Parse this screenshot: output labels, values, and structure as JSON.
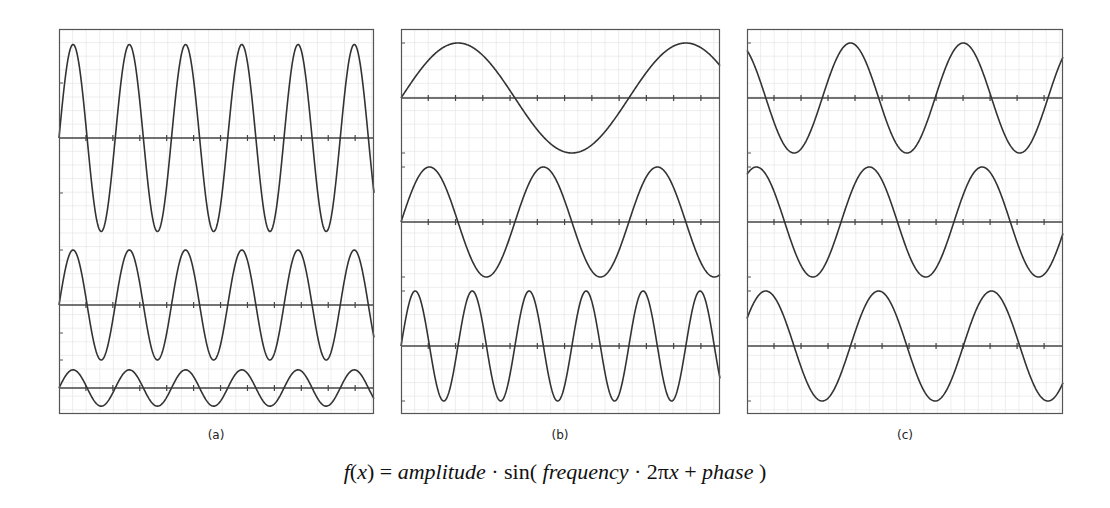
{
  "figure": {
    "panel_labels": [
      "(a)",
      "(b)",
      "(c)"
    ],
    "formula": {
      "lhs_f": "f",
      "lhs_open": "(",
      "lhs_x": "x",
      "lhs_close": ")",
      "equals": " = ",
      "amplitude": "amplitude",
      "dot1": " · ",
      "sin": "sin",
      "open": "(",
      "frequency": " frequency",
      "dot2": " · ",
      "two_pi": "2π",
      "x": "x",
      "plus": " + ",
      "phase": "phase ",
      "close": ")"
    },
    "colors": {
      "curve": "#333333",
      "axis": "#444444",
      "frame": "#555555",
      "grid": "#e6e6e6",
      "background": "#ffffff"
    }
  },
  "chart_data": [
    {
      "type": "line",
      "title": "(a)",
      "description": "Varying amplitude, constant frequency and phase",
      "x_range": [
        0,
        1
      ],
      "grid": true,
      "series": [
        {
          "name": "top",
          "amplitude": 1.7,
          "frequency": 5.6,
          "phase": 0
        },
        {
          "name": "middle",
          "amplitude": 1.0,
          "frequency": 5.6,
          "phase": 0
        },
        {
          "name": "bottom",
          "amplitude": 0.33,
          "frequency": 5.6,
          "phase": 0
        }
      ]
    },
    {
      "type": "line",
      "title": "(b)",
      "description": "Varying frequency, constant amplitude and phase",
      "x_range": [
        0,
        1
      ],
      "grid": true,
      "series": [
        {
          "name": "top",
          "amplitude": 1.0,
          "frequency": 1.4,
          "phase": 0
        },
        {
          "name": "middle",
          "amplitude": 1.0,
          "frequency": 2.8,
          "phase": 0
        },
        {
          "name": "bottom",
          "amplitude": 1.0,
          "frequency": 5.6,
          "phase": 0
        }
      ]
    },
    {
      "type": "line",
      "title": "(c)",
      "description": "Varying phase, constant amplitude and frequency",
      "x_range": [
        0,
        1
      ],
      "grid": true,
      "series": [
        {
          "name": "top",
          "amplitude": 1.0,
          "frequency": 2.8,
          "phase": 2.094
        },
        {
          "name": "middle",
          "amplitude": 1.0,
          "frequency": 2.8,
          "phase": 1.047
        },
        {
          "name": "bottom",
          "amplitude": 1.0,
          "frequency": 2.8,
          "phase": 0.524
        }
      ]
    }
  ],
  "layout": {
    "panels": [
      {
        "left": 59,
        "top": 29,
        "width": 315,
        "height": 385,
        "axes_y": [
          138,
          305,
          388
        ],
        "label_x": 216
      },
      {
        "left": 401,
        "top": 29,
        "width": 319,
        "height": 385,
        "axes_y": [
          98,
          222,
          346
        ],
        "label_x": 560
      },
      {
        "left": 747,
        "top": 29,
        "width": 316,
        "height": 385,
        "axes_y": [
          98,
          222,
          346
        ],
        "label_x": 905
      }
    ],
    "unit_px": 55,
    "label_top": 428
  }
}
